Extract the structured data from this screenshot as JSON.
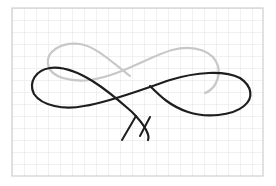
{
  "scene": {
    "description": "Hand-drawn figure-eight / infinity sketch on grid paper",
    "colors": {
      "background": "#ffffff",
      "paper_border": "#cfcfcf",
      "grid_line": "#e3e3e3",
      "gray_stroke": "#c8c8c8",
      "black_stroke": "#1e1e1e"
    },
    "paper": {
      "x": 12,
      "y": 8,
      "width": 251,
      "height": 168
    },
    "grid_spacing": 12,
    "strokes": {
      "gray_loop": "M 130 76 C 112 62, 95 46, 80 44 C 60 42, 46 52, 48 64 C 50 78, 72 82, 90 80 C 120 76, 150 56, 172 50 C 196 44, 214 52, 218 66 C 221 78, 214 90, 205 93",
      "black_loop": "M 50 68 C 80 64, 118 100, 132 112 C 146 126, 150 136, 148 140 M 50 68 C 36 70, 28 82, 34 94 C 42 106, 64 110, 84 106 C 110 102, 140 90, 170 80 C 196 72, 224 70, 240 78 C 252 86, 254 98, 244 106 C 232 116, 206 118, 188 112 C 170 106, 160 96, 150 86",
      "v_mark": "M 122 140 L 136 116 M 140 136 L 150 117"
    }
  }
}
